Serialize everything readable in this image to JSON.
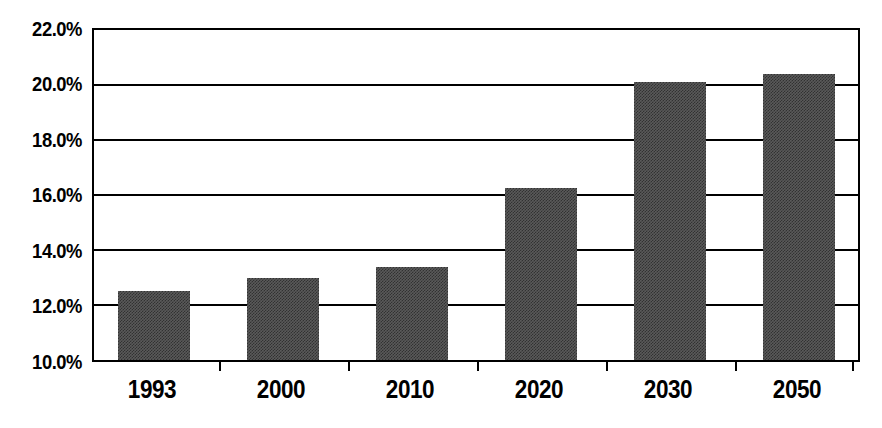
{
  "chart_data": {
    "type": "bar",
    "title": "",
    "subtitle": "",
    "xlabel": "",
    "ylabel": "",
    "categories": [
      "1993",
      "2000",
      "2010",
      "2020",
      "2030",
      "2050"
    ],
    "values": [
      12.5,
      13.0,
      13.4,
      16.25,
      20.1,
      20.4
    ],
    "value_format": "percent",
    "ylim": [
      10.0,
      22.0
    ],
    "ytick_step": 2.0,
    "ytick_labels": [
      "22.0%",
      "20.0%",
      "18.0%",
      "16.0%",
      "14.0%",
      "12.0%",
      "10.0%"
    ],
    "ytick_values": [
      22.0,
      20.0,
      18.0,
      16.0,
      14.0,
      12.0,
      10.0
    ],
    "grid": true,
    "grid_axis": "y",
    "legend": false,
    "legend_position": "none",
    "series": [
      {
        "name": "",
        "values": [
          12.5,
          13.0,
          13.4,
          16.25,
          20.1,
          20.4
        ]
      }
    ],
    "colors": {
      "bar_fill": "#5a5a5a",
      "axis": "#000000",
      "grid": "#000000",
      "background": "#ffffff",
      "text": "#000000"
    }
  }
}
